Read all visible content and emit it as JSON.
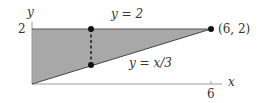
{
  "diagram": {
    "type": "region-between-curves",
    "colors": {
      "region_fill": "#a8a8a8",
      "line": "#444444",
      "axis": "#9a9a9a",
      "point": "#111111",
      "text": "#333333"
    },
    "axes": {
      "x_label": "x",
      "y_label": "y",
      "x_tick_label": "6",
      "y_tick_label": "2"
    },
    "curves": {
      "upper": {
        "label": "y = 2"
      },
      "lower": {
        "label": "y = x/3"
      }
    },
    "points": {
      "corner": {
        "label": "(6, 2)",
        "x": 6,
        "y": 2
      }
    },
    "cross_section": {
      "style": "dashed",
      "description": "vertical strip between y = x/3 and y = 2"
    }
  }
}
